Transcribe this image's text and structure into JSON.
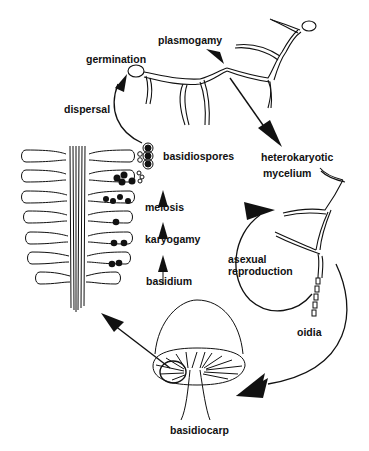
{
  "diagram": {
    "colors": {
      "line": "#111111",
      "background": "#ffffff"
    },
    "labels": {
      "germination": "germination",
      "plasmogamy": "plasmogamy",
      "dispersal": "dispersal",
      "basidiospores": "basidiospores",
      "heterokaryotic": "heterokaryotic",
      "mycelium": "mycelium",
      "meiosis": "meiosis",
      "karyogamy": "karyogamy",
      "basidium": "basidium",
      "asexual": "asexual",
      "reproduction": "reproduction",
      "oidia": "oidia",
      "basidiocarp": "basidiocarp"
    },
    "stages": [
      "basidium",
      "karyogamy",
      "meiosis",
      "basidiospores",
      "dispersal",
      "germination",
      "plasmogamy",
      "heterokaryotic mycelium",
      "basidiocarp"
    ],
    "asexual_cycle": [
      "heterokaryotic mycelium",
      "asexual reproduction",
      "oidia"
    ]
  }
}
